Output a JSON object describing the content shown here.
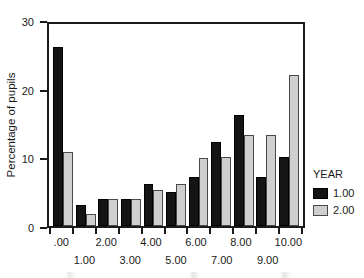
{
  "chart_data": {
    "type": "bar",
    "title": "",
    "xlabel": "",
    "ylabel": "Percentage of pupils",
    "ylim": [
      0,
      30
    ],
    "yticks": [
      "0",
      "10",
      "20",
      "30"
    ],
    "ytick_values": [
      0,
      10,
      20,
      30
    ],
    "grid": false,
    "legend_position": "right",
    "legend_title": "YEAR",
    "categories": [
      ".00",
      "1.00",
      "2.00",
      "3.00",
      "4.00",
      "5.00",
      "6.00",
      "7.00",
      "8.00",
      "9.00",
      "10.00"
    ],
    "xtick_labels_row_top": [
      ".00",
      "",
      "2.00",
      "",
      "4.00",
      "",
      "6.00",
      "",
      "8.00",
      "",
      "10.00"
    ],
    "xtick_labels_row_bottom": [
      "",
      "1.00",
      "",
      "3.00",
      "",
      "5.00",
      "",
      "7.00",
      "",
      "9.00",
      ""
    ],
    "series": [
      {
        "name": "1.00",
        "color": "#141414",
        "values": [
          26.0,
          3.0,
          4.0,
          4.0,
          6.1,
          5.0,
          7.2,
          12.2,
          16.1,
          7.2,
          10.0
        ]
      },
      {
        "name": "2.00",
        "color": "#cfcfcf",
        "values": [
          10.8,
          1.8,
          4.0,
          4.0,
          5.2,
          6.1,
          9.9,
          10.0,
          13.2,
          13.2,
          22.0
        ]
      }
    ]
  },
  "legend": {
    "title": "YEAR",
    "entries": [
      {
        "label": "1.00",
        "color": "#141414"
      },
      {
        "label": "2.00",
        "color": "#cfcfcf"
      }
    ]
  },
  "axes": {
    "y_title": "Percentage of pupils",
    "y_ticks": [
      "30",
      "20",
      "10",
      "0"
    ]
  }
}
